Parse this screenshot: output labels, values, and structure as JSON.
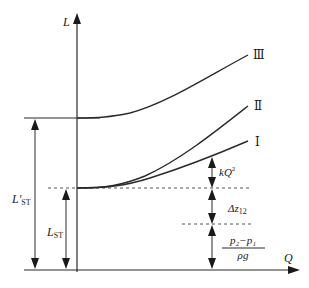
{
  "diagram": {
    "type": "pump system characteristic curves (head vs flow)",
    "axes": {
      "y_label": "L",
      "x_label": "Q"
    },
    "curves": [
      {
        "id": "I",
        "label": "Ⅰ"
      },
      {
        "id": "II",
        "label": "Ⅱ"
      },
      {
        "id": "III",
        "label": "Ⅲ"
      }
    ],
    "dimensions": {
      "l_st_prime": {
        "main": "L′",
        "sub": "ST"
      },
      "l_st": {
        "main": "L",
        "sub": "ST"
      },
      "kq2": {
        "main": "kQ",
        "sup": "2"
      },
      "delta_z": {
        "main": "Δz",
        "sub": "12"
      },
      "pressure_term": {
        "numerator": "p₂−p₁",
        "denominator": "ρg"
      }
    },
    "colors": {
      "line": "#2a2a2a",
      "dashed": "#555555",
      "background": "#ffffff"
    }
  }
}
